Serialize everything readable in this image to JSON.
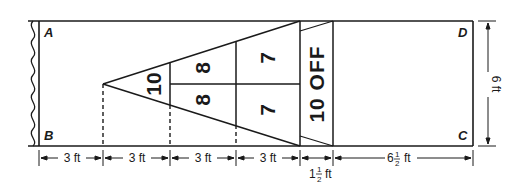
{
  "diagram": {
    "corners": {
      "a": "A",
      "b": "B",
      "c": "C",
      "d": "D"
    },
    "zones": {
      "tip": "10",
      "middle_top": "8",
      "middle_bottom": "8",
      "back_top": "7",
      "back_bottom": "7",
      "off": "10 OFF"
    },
    "dimensions": {
      "seg1": "3 ft",
      "seg2": "3 ft",
      "seg3": "3 ft",
      "seg4": "3 ft",
      "seg5_whole": "1",
      "seg5_num": "1",
      "seg5_den": "2",
      "seg5_unit": "ft",
      "seg6_whole": "6",
      "seg6_num": "1",
      "seg6_den": "2",
      "seg6_unit": "ft",
      "height": "6 ft"
    },
    "colors": {
      "line": "#1a1a1a",
      "background": "#ffffff"
    }
  }
}
